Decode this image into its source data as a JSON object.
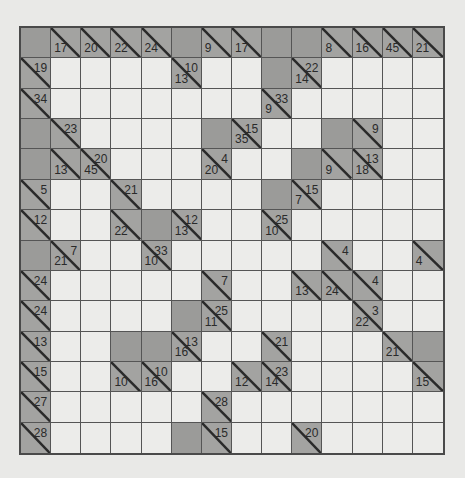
{
  "puzzle": {
    "type": "Kakuro",
    "rows": 14,
    "cols": 14,
    "colors": {
      "background": "#e9e9e7",
      "white_cell": "#ececea",
      "block_cell": "#9b9b99",
      "clue_cell": "#a3a3a1",
      "grid_line": "#555555"
    },
    "legend": "Cell codes: B = blocked, W = empty entry cell, r = across sum (top-right), d = down sum (bottom-left)",
    "grid": [
      [
        "B",
        "d17",
        "d20",
        "d22",
        "d24",
        "B",
        "d9",
        "d17",
        "B",
        "B",
        "d8",
        "d16",
        "d45",
        "d21"
      ],
      [
        "r19",
        "W",
        "W",
        "W",
        "W",
        "r10/d13",
        "W",
        "W",
        "B",
        "r22/d14",
        "W",
        "W",
        "W",
        "W"
      ],
      [
        "r34",
        "W",
        "W",
        "W",
        "W",
        "W",
        "W",
        "W",
        "r33/d9",
        "W",
        "W",
        "W",
        "W",
        "W"
      ],
      [
        "B",
        "r23",
        "W",
        "W",
        "W",
        "W",
        "B",
        "r15/d35",
        "W",
        "W",
        "B",
        "r9",
        "W",
        "W"
      ],
      [
        "B",
        "d13",
        "r20/d45",
        "W",
        "W",
        "W",
        "r4/d20",
        "W",
        "W",
        "B",
        "d9",
        "r13/d18",
        "W",
        "W"
      ],
      [
        "r5",
        "W",
        "W",
        "r21",
        "W",
        "W",
        "W",
        "W",
        "B",
        "r15/d7",
        "W",
        "W",
        "W",
        "W"
      ],
      [
        "r12",
        "W",
        "W",
        "d22",
        "B",
        "r12/d13",
        "W",
        "W",
        "r25/d10",
        "W",
        "W",
        "W",
        "W",
        "W"
      ],
      [
        "B",
        "r7/d21",
        "W",
        "W",
        "r33/d10",
        "W",
        "W",
        "W",
        "W",
        "W",
        "r4",
        "W",
        "W",
        "d4"
      ],
      [
        "r24",
        "W",
        "W",
        "W",
        "W",
        "W",
        "r7",
        "W",
        "W",
        "d13",
        "d24",
        "r4",
        "W",
        "W"
      ],
      [
        "r24",
        "W",
        "W",
        "W",
        "W",
        "B",
        "r25/d11",
        "W",
        "W",
        "W",
        "W",
        "r3/d22",
        "W",
        "W"
      ],
      [
        "r13",
        "W",
        "W",
        "B",
        "B",
        "r13/d16",
        "W",
        "W",
        "r21",
        "W",
        "W",
        "W",
        "d21",
        "B"
      ],
      [
        "r15",
        "W",
        "W",
        "d10",
        "r10/d16",
        "W",
        "W",
        "d12",
        "r23/d14",
        "W",
        "W",
        "W",
        "W",
        "d15"
      ],
      [
        "r27",
        "W",
        "W",
        "W",
        "W",
        "W",
        "r28",
        "W",
        "W",
        "W",
        "W",
        "W",
        "W",
        "W"
      ],
      [
        "r28",
        "W",
        "W",
        "W",
        "W",
        "B",
        "r15",
        "W",
        "W",
        "r20",
        "W",
        "W",
        "W",
        "W"
      ]
    ]
  }
}
